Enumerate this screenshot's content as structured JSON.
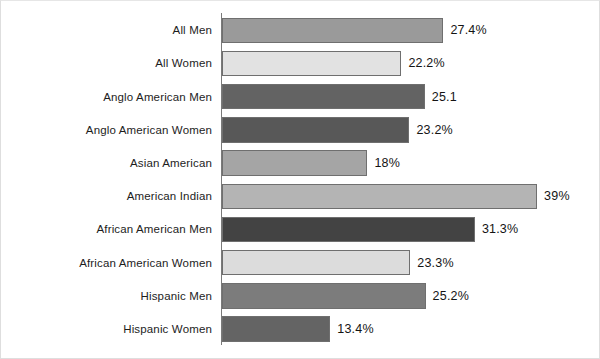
{
  "chart_data": {
    "type": "bar",
    "orientation": "horizontal",
    "title": "",
    "subtitle": "",
    "xlabel": "",
    "ylabel": "",
    "grid": false,
    "legend": false,
    "xlim": [
      0,
      46
    ],
    "unit": "%",
    "categories": [
      "All Men",
      "All Women",
      "Anglo American Men",
      "Anglo American Women",
      "Asian American",
      "American Indian",
      "African American Men",
      "African American Women",
      "Hispanic Men",
      "Hispanic Women"
    ],
    "values": [
      27.4,
      22.2,
      25.1,
      23.2,
      18,
      39,
      31.3,
      23.3,
      25.2,
      13.4
    ],
    "data_labels": [
      "27.4%",
      "22.2%",
      "25.1",
      "23.2%",
      "18%",
      "39%",
      "31.3%",
      "23.3%",
      "25.2%",
      "13.4%"
    ],
    "bar_colors": [
      "#9a9a9a",
      "#e2e2e2",
      "#636363",
      "#585858",
      "#a5a5a5",
      "#b4b4b4",
      "#434343",
      "#dcdcdc",
      "#7c7c7c",
      "#646464"
    ],
    "bar_border_color": "#6f6f6f",
    "background_color": "#ffffff",
    "text_color": "#1d1d1d"
  }
}
